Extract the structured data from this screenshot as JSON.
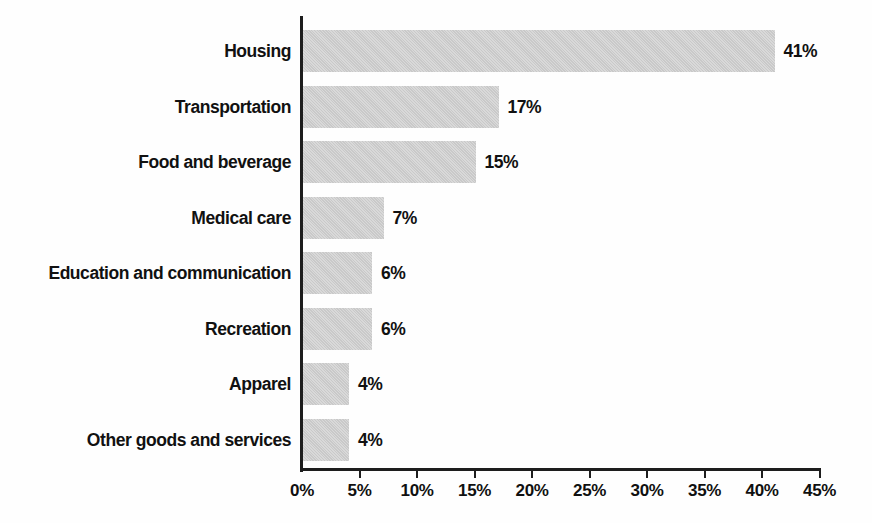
{
  "chart_data": {
    "type": "bar",
    "orientation": "horizontal",
    "title": "",
    "subtitle": "",
    "xlabel": "",
    "ylabel": "",
    "xlim": [
      0,
      45
    ],
    "xtick_step": 5,
    "grid": false,
    "legend": false,
    "bar_color": "#c9c9c9",
    "axis_color": "#1d1d1d",
    "text_color": "#111111",
    "categories": [
      "Housing",
      "Transportation",
      "Food and beverage",
      "Medical care",
      "Education and communication",
      "Recreation",
      "Apparel",
      "Other goods and services"
    ],
    "values": [
      41,
      17,
      15,
      7,
      6,
      6,
      4,
      4
    ],
    "data_labels": [
      "41%",
      "17%",
      "15%",
      "7%",
      "6%",
      "6%",
      "4%",
      "4%"
    ],
    "xticks": [
      0,
      5,
      10,
      15,
      20,
      25,
      30,
      35,
      40,
      45
    ],
    "xtick_labels": [
      "0%",
      "5%",
      "10%",
      "15%",
      "20%",
      "25%",
      "30%",
      "35%",
      "40%",
      "45%"
    ]
  }
}
